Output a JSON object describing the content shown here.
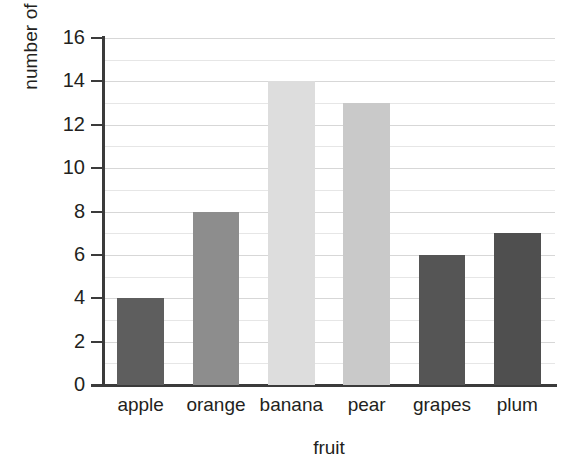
{
  "chart_data": {
    "type": "bar",
    "title": "",
    "xlabel": "fruit",
    "ylabel": "number of people",
    "categories": [
      "apple",
      "orange",
      "banana",
      "pear",
      "grapes",
      "plum"
    ],
    "values": [
      4,
      8,
      14,
      13,
      6,
      7
    ],
    "bar_colors": [
      "#5e5e5e",
      "#8d8d8d",
      "#dddddd",
      "#c9c9c9",
      "#555555",
      "#4f4f4f"
    ],
    "ylim": [
      0,
      16
    ],
    "ytick_labels": [
      "0",
      "2",
      "4",
      "6",
      "8",
      "10",
      "12",
      "14",
      "16"
    ],
    "ytick_values": [
      0,
      2,
      4,
      6,
      8,
      10,
      12,
      14,
      16
    ],
    "minor_gridline_values": [
      1,
      3,
      5,
      7,
      9,
      11,
      13,
      15
    ],
    "grid": true,
    "legend": "none",
    "axis_color": "#3b3b3b",
    "gridline_color": "#d7d7d7",
    "background": "#ffffff"
  }
}
